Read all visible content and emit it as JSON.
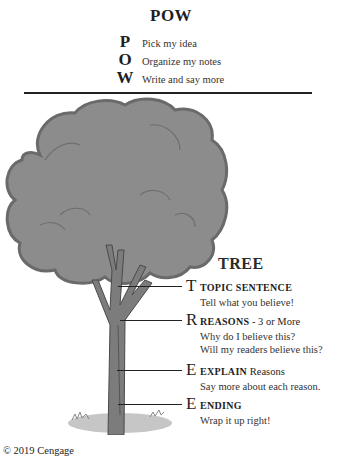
{
  "pow": {
    "title": "POW",
    "items": [
      {
        "letter": "P",
        "text": "Pick my idea"
      },
      {
        "letter": "O",
        "text": "Organize my notes"
      },
      {
        "letter": "W",
        "text": "Write and say more"
      }
    ]
  },
  "tree": {
    "title": "TREE",
    "items": [
      {
        "letter": "T",
        "heading": "TOPIC SENTENCE",
        "suffix": "",
        "lines": [
          "Tell what you believe!"
        ]
      },
      {
        "letter": "R",
        "heading": "REASONS",
        "suffix": " - 3 or More",
        "lines": [
          "Why do I believe this?",
          "Will my readers believe this?"
        ]
      },
      {
        "letter": "E",
        "heading": "EXPLAIN",
        "suffix": " Reasons",
        "lines": [
          "Say more about each reason."
        ]
      },
      {
        "letter": "E",
        "heading": "ENDING",
        "suffix": "",
        "lines": [
          "Wrap it up right!"
        ]
      }
    ]
  },
  "footer": {
    "copyright": "© 2019 Cengage"
  },
  "colors": {
    "foliage": "#8a8a8a",
    "foliage_edge": "#6e6e6e",
    "trunk": "#7a7a7a",
    "ground": "#c4c4c4"
  }
}
